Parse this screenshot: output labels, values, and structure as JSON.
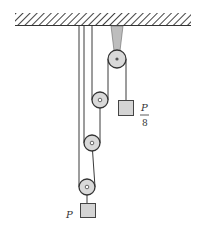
{
  "diagram": {
    "type": "pulley-system",
    "ceiling": {
      "x1": 15,
      "x2": 191,
      "y_top": 13,
      "y_bottom": 26
    },
    "pulleys": [
      {
        "id": "fixed-pulley",
        "cx": 117,
        "cy": 59,
        "r": 9,
        "fixed": true
      },
      {
        "id": "movable-pulley-1",
        "cx": 100,
        "cy": 100,
        "r": 8
      },
      {
        "id": "movable-pulley-2",
        "cx": 92,
        "cy": 143,
        "r": 8
      },
      {
        "id": "movable-pulley-3",
        "cx": 87,
        "cy": 187,
        "r": 8
      }
    ],
    "weights": [
      {
        "id": "load",
        "label": "P"
      },
      {
        "id": "effort",
        "label_num": "P",
        "label_den": "8"
      }
    ]
  },
  "labels": {
    "load": "P",
    "effort_numerator": "P",
    "effort_denominator": "8"
  },
  "colors": {
    "line": "#3a3a3a",
    "pulley_fill": "#d9d9d9",
    "box_fill": "#d4d4d4",
    "bracket": "#bdbdbd"
  }
}
